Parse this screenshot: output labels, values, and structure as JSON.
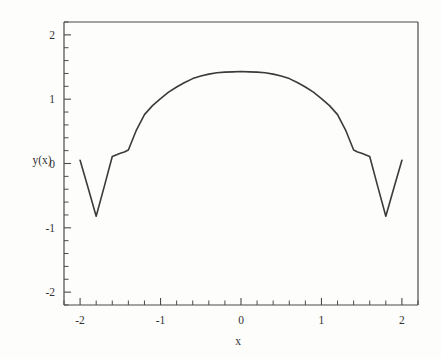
{
  "chart_data": {
    "type": "line",
    "title": "",
    "subtitle": "",
    "xlabel": "x",
    "ylabel": "y(x)",
    "xlim": [
      -2.2,
      2.2
    ],
    "ylim": [
      -2.2,
      2.2
    ],
    "xticks": [
      -2,
      -1,
      0,
      1,
      2
    ],
    "xticklabels": [
      "-2",
      "-1",
      "0",
      "1",
      "2"
    ],
    "yticks": [
      -2,
      -1,
      0,
      1,
      2
    ],
    "yticklabels": [
      "-2",
      "-1",
      "0",
      "1",
      "2"
    ],
    "x_minor_tick_count": 5,
    "y_minor_tick_count": 5,
    "grid": false,
    "legend": false,
    "legend_position": "none",
    "line_color": "#3b3b3b",
    "axis_color": "#4a4a4a",
    "background_color": "#fdfdfc",
    "series": [
      {
        "name": "y(x)",
        "x": [
          -2.0,
          -1.9,
          -1.8,
          -1.7,
          -1.6,
          -1.5,
          -1.45,
          -1.4,
          -1.3,
          -1.2,
          -1.1,
          -1.0,
          -0.9,
          -0.8,
          -0.7,
          -0.6,
          -0.5,
          -0.4,
          -0.3,
          -0.2,
          -0.1,
          0.0,
          0.1,
          0.2,
          0.3,
          0.4,
          0.5,
          0.6,
          0.7,
          0.8,
          0.9,
          1.0,
          1.1,
          1.2,
          1.3,
          1.4,
          1.45,
          1.5,
          1.6,
          1.7,
          1.8,
          1.9,
          2.0
        ],
        "y": [
          0.05,
          -0.38,
          -0.82,
          -0.36,
          0.11,
          0.16,
          0.18,
          0.21,
          0.52,
          0.76,
          0.9,
          1.01,
          1.11,
          1.19,
          1.26,
          1.32,
          1.36,
          1.39,
          1.41,
          1.42,
          1.425,
          1.43,
          1.425,
          1.42,
          1.41,
          1.39,
          1.36,
          1.32,
          1.26,
          1.19,
          1.11,
          1.01,
          0.9,
          0.76,
          0.52,
          0.21,
          0.18,
          0.16,
          0.11,
          -0.36,
          -0.82,
          -0.38,
          0.05
        ]
      }
    ],
    "annotations": []
  },
  "axis": {
    "y_label_text": "y(x)",
    "x_label_text": "x"
  }
}
